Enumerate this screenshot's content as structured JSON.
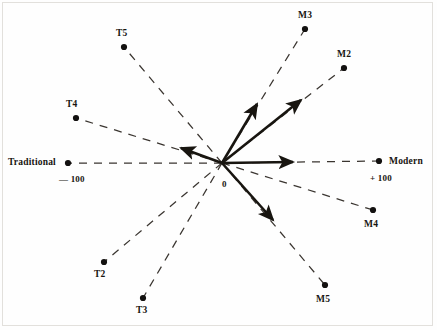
{
  "chart_data": {
    "type": "scatter",
    "title": "",
    "subtitle": "",
    "xlabel": "",
    "ylabel": "",
    "grid": false,
    "legend": null,
    "axis_scale": {
      "min_label": "— 100",
      "max_label": "+ 100",
      "origin_label": "0",
      "min_pole": "Traditional",
      "max_pole": "Modern",
      "range": [
        -100,
        100
      ]
    },
    "center": {
      "x": 222,
      "y": 163
    },
    "axes": [
      {
        "name": "traditional-axis",
        "label": "Traditional",
        "value_label": "— 100",
        "endpoint": {
          "x": 68,
          "y": 163
        },
        "style": "dashed"
      },
      {
        "name": "modern-axis",
        "label": "Modern",
        "value_label": "+ 100",
        "endpoint": {
          "x": 379,
          "y": 161
        },
        "style": "dashed"
      },
      {
        "name": "axis-T5",
        "label": "T5",
        "endpoint": {
          "x": 124,
          "y": 47
        },
        "style": "dashed"
      },
      {
        "name": "axis-T4",
        "label": "T4",
        "endpoint": {
          "x": 76,
          "y": 118
        },
        "style": "dashed"
      },
      {
        "name": "axis-T2",
        "label": "T2",
        "endpoint": {
          "x": 104,
          "y": 262
        },
        "style": "dashed"
      },
      {
        "name": "axis-T3",
        "label": "T3",
        "endpoint": {
          "x": 143,
          "y": 298
        },
        "style": "dashed"
      },
      {
        "name": "axis-M3",
        "label": "M3",
        "endpoint": {
          "x": 305,
          "y": 29
        },
        "style": "dashed"
      },
      {
        "name": "axis-M2",
        "label": "M2",
        "endpoint": {
          "x": 344,
          "y": 68
        },
        "style": "dashed"
      },
      {
        "name": "axis-M4",
        "label": "M4",
        "endpoint": {
          "x": 373,
          "y": 210
        },
        "style": "dashed"
      },
      {
        "name": "axis-M5",
        "label": "M5",
        "endpoint": {
          "x": 325,
          "y": 285
        },
        "style": "dashed"
      }
    ],
    "points": [
      {
        "label": "T5",
        "x": 124,
        "y": 47
      },
      {
        "label": "T4",
        "x": 76,
        "y": 118
      },
      {
        "label": "T2",
        "x": 104,
        "y": 262
      },
      {
        "label": "T3",
        "x": 143,
        "y": 298
      },
      {
        "label": "M3",
        "x": 305,
        "y": 29
      },
      {
        "label": "M2",
        "x": 344,
        "y": 68
      },
      {
        "label": "M4",
        "x": 373,
        "y": 210
      },
      {
        "label": "M5",
        "x": 325,
        "y": 285
      },
      {
        "label": "Traditional",
        "x": 68,
        "y": 163
      },
      {
        "label": "Modern",
        "x": 379,
        "y": 161
      }
    ],
    "vectors": [
      {
        "name": "vector-up-steep",
        "from": {
          "x": 222,
          "y": 163
        },
        "to": {
          "x": 257,
          "y": 104
        }
      },
      {
        "name": "vector-up-shallow",
        "from": {
          "x": 222,
          "y": 163
        },
        "to": {
          "x": 301,
          "y": 100
        }
      },
      {
        "name": "vector-right",
        "from": {
          "x": 222,
          "y": 163
        },
        "to": {
          "x": 293,
          "y": 162
        }
      },
      {
        "name": "vector-down-right",
        "from": {
          "x": 222,
          "y": 163
        },
        "to": {
          "x": 273,
          "y": 220
        }
      },
      {
        "name": "vector-left",
        "from": {
          "x": 222,
          "y": 163
        },
        "to": {
          "x": 181,
          "y": 148
        }
      }
    ],
    "colors": {
      "ink": "#181510",
      "dash": "#3a3530",
      "background": "#ffffff",
      "frame": "#e2e0dc"
    }
  },
  "labels": {
    "traditional": "Traditional",
    "modern": "Modern",
    "minus_hundred": "— 100",
    "plus_hundred": "+ 100",
    "origin": "0",
    "t2": "T2",
    "t3": "T3",
    "t4": "T4",
    "t5": "T5",
    "m2": "M2",
    "m3": "M3",
    "m4": "M4",
    "m5": "M5"
  }
}
